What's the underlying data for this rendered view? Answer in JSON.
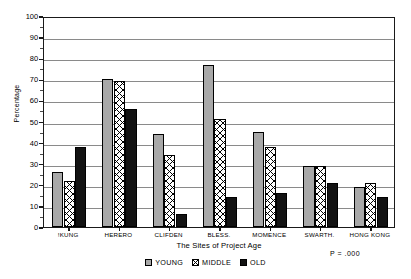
{
  "chart_data": {
    "type": "bar",
    "title": "",
    "xlabel": "The Sites of Project Age",
    "ylabel": "Percentage",
    "ylim": [
      0,
      100
    ],
    "ytick_step": 10,
    "yticks": [
      0,
      10,
      20,
      30,
      40,
      50,
      60,
      70,
      80,
      90,
      100
    ],
    "grid": true,
    "legend_position": "bottom-center",
    "categories": [
      "!KUNG",
      "HERERO",
      "CLIFDEN",
      "BLESS.",
      "MOMENCE",
      "SWARTH.",
      "HONG KONG"
    ],
    "series": [
      {
        "name": "YOUNG",
        "values": [
          26,
          70,
          44,
          77,
          45,
          29,
          19
        ],
        "color": "#a8a8a8",
        "pattern": "stipple"
      },
      {
        "name": "MIDDLE",
        "values": [
          22,
          69,
          34,
          51,
          38,
          29,
          21
        ],
        "color": "#ffffff",
        "pattern": "crosshatch"
      },
      {
        "name": "OLD",
        "values": [
          38,
          56,
          6,
          14,
          16,
          21,
          14
        ],
        "color": "#121212",
        "pattern": "solid"
      }
    ],
    "annotations": [
      {
        "name": "p-value",
        "text": "P = .000"
      }
    ]
  },
  "axis": {
    "y_title": "Percentage",
    "x_title": "The Sites of Project Age",
    "y_ticks": [
      "100",
      "90",
      "80",
      "70",
      "60",
      "50",
      "40",
      "30",
      "20",
      "10",
      "0"
    ]
  },
  "legend": {
    "items": [
      {
        "label": "YOUNG"
      },
      {
        "label": "MIDDLE"
      },
      {
        "label": "OLD"
      }
    ]
  },
  "footnote": {
    "p_value": "P = .000"
  }
}
